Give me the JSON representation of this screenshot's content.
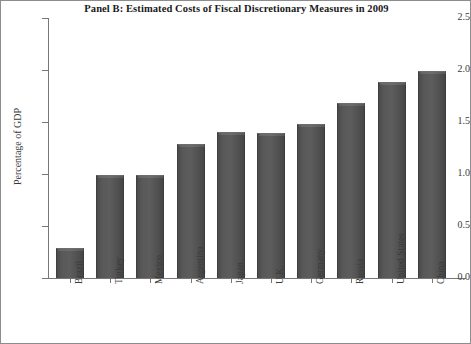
{
  "chart_data": {
    "type": "bar",
    "title": "Panel B: Estimated Costs of Fiscal Discretionary Measures in 2009",
    "xlabel": "",
    "ylabel": "Percentage of GDP",
    "ylim": [
      0.0,
      2.5
    ],
    "ytick_labels": [
      "0.0",
      "0.5",
      "1.0",
      "1.5",
      "2.0",
      "2.5"
    ],
    "ytick_values": [
      0.0,
      0.5,
      1.0,
      1.5,
      2.0,
      2.5
    ],
    "grid": false,
    "legend": false,
    "bar_color": "#565656",
    "categories": [
      "Brazil",
      "Turkey",
      "Mexico",
      "Argentina",
      "Japan",
      "U.K.",
      "Germany",
      "Russia",
      "United States",
      "China"
    ],
    "values": [
      0.29,
      0.99,
      0.99,
      1.29,
      1.4,
      1.39,
      1.48,
      1.68,
      1.88,
      1.99
    ]
  }
}
